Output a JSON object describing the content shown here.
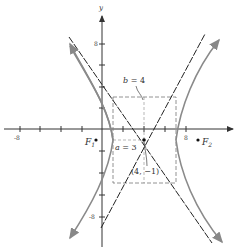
{
  "figure": {
    "type": "hyperbola",
    "equation": "(x-4)^2/9 - (y+1)^2/16 = 1",
    "center": [
      4,
      -1
    ],
    "a": 3,
    "b": 4,
    "colors": {
      "axis": "#333333",
      "curve": "#808080",
      "asymptote": "#222222",
      "box": "#777777"
    }
  },
  "axes": {
    "x_label": "x",
    "y_label": "y",
    "x_ticks": [
      "-8",
      "8"
    ],
    "y_ticks": [
      "8",
      "-8"
    ]
  },
  "labels": {
    "b": "b = 4",
    "a": "a = 3",
    "center": "(4, −1)",
    "f1": "F",
    "f1_sub": "1",
    "f2": "F",
    "f2_sub": "2"
  }
}
